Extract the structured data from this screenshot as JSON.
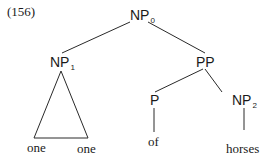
{
  "example_number": "(156)",
  "nodes": {
    "np0": {
      "cat": "NP",
      "sub": "0"
    },
    "np1": {
      "cat": "NP",
      "sub": "1"
    },
    "pp": {
      "cat": "PP",
      "sub": ""
    },
    "p": {
      "cat": "P",
      "sub": ""
    },
    "np2": {
      "cat": "NP",
      "sub": "2"
    }
  },
  "leaves": {
    "one_left": "one",
    "one_right": "one",
    "of": "of",
    "horses": "horses"
  },
  "edges": [
    {
      "from": "NP0",
      "to": "NP1"
    },
    {
      "from": "NP0",
      "to": "PP"
    },
    {
      "from": "NP1",
      "to": "triangle(one one)"
    },
    {
      "from": "PP",
      "to": "P"
    },
    {
      "from": "PP",
      "to": "NP2"
    },
    {
      "from": "P",
      "to": "of"
    },
    {
      "from": "NP2",
      "to": "horses"
    }
  ]
}
